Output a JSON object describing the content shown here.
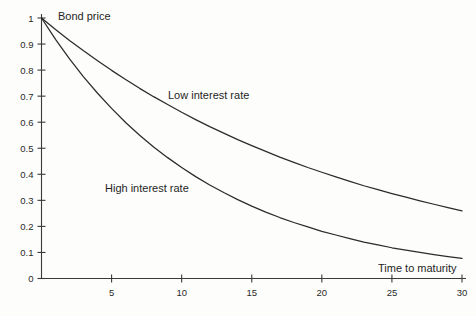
{
  "chart_data": {
    "type": "line",
    "title": "",
    "xlabel": "Time to maturity",
    "ylabel": "Bond price",
    "xlim": [
      0,
      30
    ],
    "ylim": [
      0,
      1
    ],
    "grid": false,
    "legend_position": "inline-annotations",
    "x_ticks": [
      5,
      10,
      15,
      20,
      25,
      30
    ],
    "x_tick_labels": [
      "5",
      "10",
      "15",
      "20",
      "25",
      "30"
    ],
    "y_ticks": [
      0,
      0.1,
      0.2,
      0.3,
      0.4,
      0.5,
      0.6,
      0.7,
      0.8,
      0.9,
      1
    ],
    "y_tick_labels": [
      "0",
      "0.1",
      "0.2",
      "0.3",
      "0.4",
      "0.5",
      "0.6",
      "0.7",
      "0.8",
      "0.9",
      "1"
    ],
    "annotations": [
      {
        "text": "Bond price",
        "x_px": 58,
        "y_px": 20
      },
      {
        "text": "Low interest rate",
        "x_px": 168,
        "y_px": 99
      },
      {
        "text": "High interest rate",
        "x_px": 105,
        "y_px": 192
      },
      {
        "text": "Time to maturity",
        "x_px": 378,
        "y_px": 272
      }
    ],
    "x": [
      0,
      1,
      2,
      3,
      4,
      5,
      6,
      7,
      8,
      9,
      10,
      11,
      12,
      13,
      14,
      15,
      16,
      17,
      18,
      19,
      20,
      21,
      22,
      23,
      24,
      25,
      26,
      27,
      28,
      29,
      30
    ],
    "series": [
      {
        "name": "Low interest rate",
        "values": [
          1.0,
          0.956,
          0.914,
          0.874,
          0.836,
          0.799,
          0.764,
          0.73,
          0.698,
          0.668,
          0.638,
          0.61,
          0.583,
          0.558,
          0.533,
          0.51,
          0.488,
          0.466,
          0.446,
          0.426,
          0.408,
          0.39,
          0.373,
          0.356,
          0.341,
          0.326,
          0.312,
          0.298,
          0.285,
          0.272,
          0.26
        ]
      },
      {
        "name": "High interest rate",
        "values": [
          1.0,
          0.918,
          0.843,
          0.774,
          0.711,
          0.653,
          0.599,
          0.55,
          0.505,
          0.464,
          0.426,
          0.391,
          0.359,
          0.33,
          0.303,
          0.278,
          0.255,
          0.234,
          0.215,
          0.198,
          0.181,
          0.167,
          0.153,
          0.14,
          0.129,
          0.118,
          0.109,
          0.1,
          0.092,
          0.084,
          0.077
        ]
      }
    ],
    "colors": {
      "axis": "#3a3a38",
      "curve": "#2b2b29",
      "background": "#fdfdfc",
      "text": "#1f1f1d"
    }
  }
}
